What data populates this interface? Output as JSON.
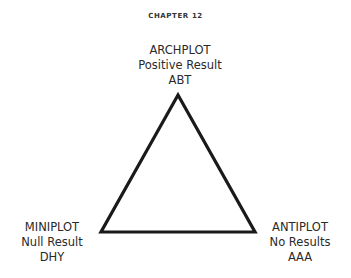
{
  "header": {
    "chapter": "CHAPTER 12"
  },
  "diagram": {
    "type": "triangle",
    "stroke_color": "#1a1a1a",
    "vertices": {
      "top": {
        "title": "ARCHPLOT",
        "subtitle": "Positive Result",
        "code": "ABT"
      },
      "bottom_left": {
        "title": "MINIPLOT",
        "subtitle": "Null Result",
        "code": "DHY"
      },
      "bottom_right": {
        "title": "ANTIPLOT",
        "subtitle": "No Results",
        "code": "AAA"
      }
    }
  }
}
